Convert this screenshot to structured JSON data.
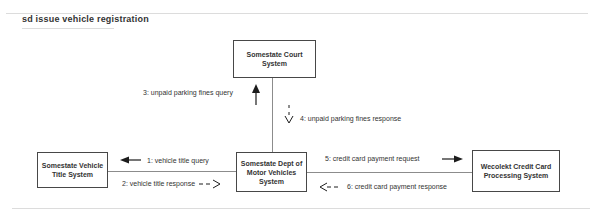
{
  "frame": {
    "label": "sd issue vehicle registration"
  },
  "colors": {
    "background": "#ffffff",
    "box_border": "#474747",
    "text": "#333333",
    "frame_line": "#dcdcdc",
    "connector": "#8c8c8c",
    "arrow": "#1c1c1c"
  },
  "nodes": {
    "court": {
      "lines": [
        "Somestate Court",
        "System"
      ]
    },
    "vehicle_title": {
      "lines": [
        "Somestate Vehicle",
        "Title System"
      ]
    },
    "dmv": {
      "lines": [
        "Somestate Dept of",
        "Motor Vehicles",
        "System"
      ]
    },
    "wecolekt": {
      "lines": [
        "Wecolekt Credit Card",
        "Processing System"
      ]
    }
  },
  "messages": {
    "m1": {
      "label": "1: vehicle title query",
      "style": "solid",
      "direction": "left"
    },
    "m2": {
      "label": "2: vehicle title response",
      "style": "dashed",
      "direction": "right"
    },
    "m3": {
      "label": "3: unpaid parking fines query",
      "style": "solid",
      "direction": "up"
    },
    "m4": {
      "label": "4: unpaid parking fines response",
      "style": "dashed",
      "direction": "down"
    },
    "m5": {
      "label": "5: credit card payment request",
      "style": "solid",
      "direction": "right"
    },
    "m6": {
      "label": "6: credit card payment response",
      "style": "dashed",
      "direction": "left"
    }
  }
}
